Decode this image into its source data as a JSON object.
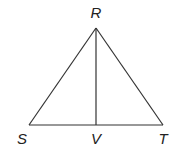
{
  "diagram": {
    "type": "geometry-triangle",
    "stroke_color": "#333333",
    "label_color": "#222222",
    "points": {
      "R": {
        "label": "R",
        "x": 96,
        "y": 28
      },
      "S": {
        "label": "S",
        "x": 29,
        "y": 125
      },
      "T": {
        "label": "T",
        "x": 163,
        "y": 125
      },
      "V": {
        "label": "V",
        "x": 96,
        "y": 125
      }
    },
    "segments": [
      {
        "from": "R",
        "to": "S",
        "name": "RS"
      },
      {
        "from": "R",
        "to": "T",
        "name": "RT"
      },
      {
        "from": "S",
        "to": "T",
        "name": "ST"
      },
      {
        "from": "R",
        "to": "V",
        "name": "RV"
      }
    ]
  }
}
